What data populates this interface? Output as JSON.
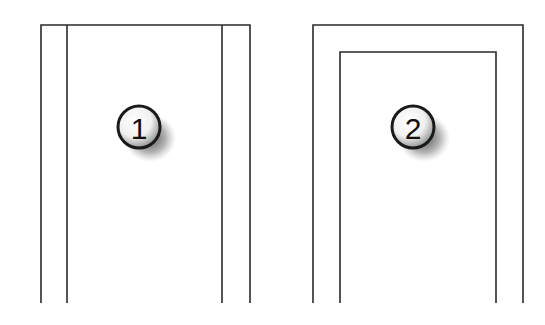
{
  "figures": [
    {
      "id": "figure-1",
      "label": "1",
      "description": "Rectangle open at bottom with two inner vertical lines",
      "outer": {
        "left": 41,
        "right": 250,
        "top": 25,
        "bottom": 303
      },
      "inner_lines_x": [
        67,
        222
      ],
      "badge": {
        "cx": 140,
        "cy": 128
      }
    },
    {
      "id": "figure-2",
      "label": "2",
      "description": "Nested rectangles open at bottom",
      "outer": {
        "left": 313,
        "right": 523,
        "top": 25,
        "bottom": 303
      },
      "inner": {
        "left": 340,
        "right": 496,
        "top": 52,
        "bottom": 303
      },
      "badge": {
        "cx": 413,
        "cy": 128
      }
    }
  ],
  "colors": {
    "line": "#2a2a2a",
    "background": "#ffffff"
  }
}
